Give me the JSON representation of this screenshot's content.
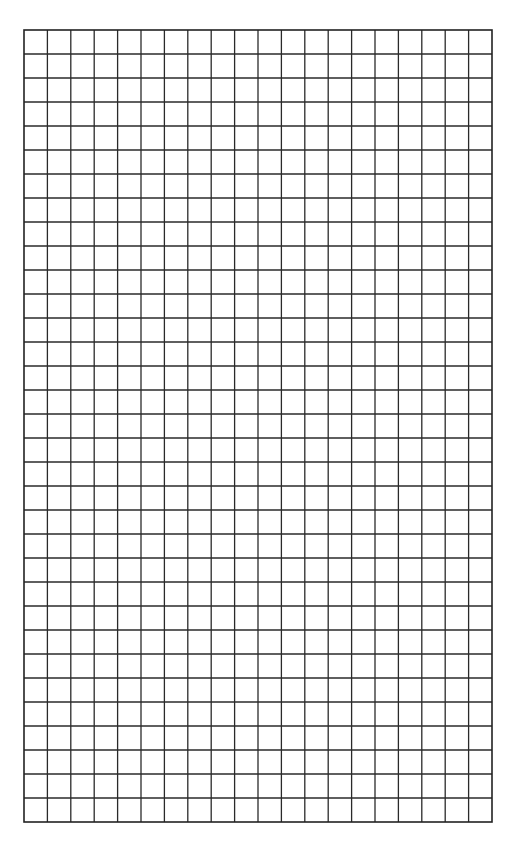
{
  "document": {
    "type": "graph-paper",
    "title": "",
    "background_color": "#ffffff"
  },
  "grid": {
    "columns": 20,
    "rows": 33,
    "left": 24,
    "top": 30,
    "width": 468,
    "height": 792,
    "cell_width": 23.4,
    "cell_height": 24,
    "line_color": "#2a2a2a",
    "line_width": 1.3,
    "border_color": "#222222",
    "border_width": 1.6
  }
}
